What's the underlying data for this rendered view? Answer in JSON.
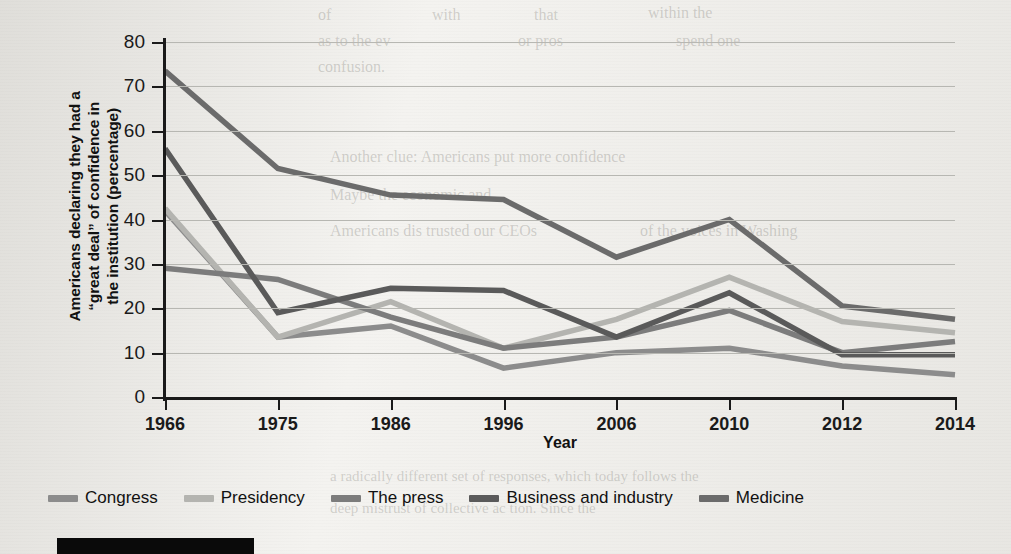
{
  "chart_data": {
    "type": "line",
    "title": "",
    "xlabel": "Year",
    "ylabel": "Americans declaring they had a “great deal” of confidence in the institution (percentage)",
    "ylabel_lines": [
      "Americans declaring they had a",
      "“great deal” of confidence in",
      "the institution (percentage)"
    ],
    "categories": [
      "1966",
      "1975",
      "1986",
      "1996",
      "2006",
      "2010",
      "2012",
      "2014"
    ],
    "x": [
      1966,
      1975,
      1986,
      1996,
      2006,
      2010,
      2012,
      2014
    ],
    "ylim": [
      0,
      80
    ],
    "yticks": [
      0,
      10,
      20,
      30,
      40,
      50,
      60,
      70,
      80
    ],
    "grid": true,
    "legend_position": "bottom",
    "series": [
      {
        "name": "Congress",
        "color": "#8c8c8c",
        "values": [
          42,
          13.5,
          16,
          6.5,
          10,
          11,
          7,
          5
        ]
      },
      {
        "name": "Presidency",
        "color": "#b4b4b0",
        "values": [
          42.5,
          13.5,
          21.5,
          11,
          17.5,
          27,
          17,
          14.5
        ]
      },
      {
        "name": "The press",
        "color": "#7c7c7c",
        "values": [
          29,
          26.5,
          18,
          11,
          13.5,
          19.5,
          10,
          12.5
        ]
      },
      {
        "name": "Business and industry",
        "color": "#5a5a5a",
        "values": [
          56,
          19,
          24.5,
          24,
          13.5,
          23.5,
          9.5,
          9.5
        ]
      },
      {
        "name": "Medicine",
        "color": "#6b6b6b",
        "values": [
          73.5,
          51.5,
          45.5,
          44.5,
          31.5,
          40,
          20.5,
          17.5
        ]
      }
    ]
  },
  "legend": {
    "items": [
      {
        "label": "Congress"
      },
      {
        "label": "Presidency"
      },
      {
        "label": "The press"
      },
      {
        "label": "Business and industry"
      },
      {
        "label": "Medicine"
      }
    ]
  },
  "axis_titles": {
    "x": "Year"
  },
  "ghost_text": {
    "lines": [
      "of",
      "with",
      "that",
      "within the",
      "as to the ev",
      "or  pros",
      "spend  one",
      "confusion.",
      "Another clue: Americans put more confidence",
      "Maybe  the economic and",
      "Americans  dis  trusted  our  CEOs",
      "of  the  voices  in  Washing",
      "a radically  different  set  of  responses,  which  today  follows  the",
      "deep  mistrust  of  collective  ac  tion.  Since  the"
    ]
  }
}
